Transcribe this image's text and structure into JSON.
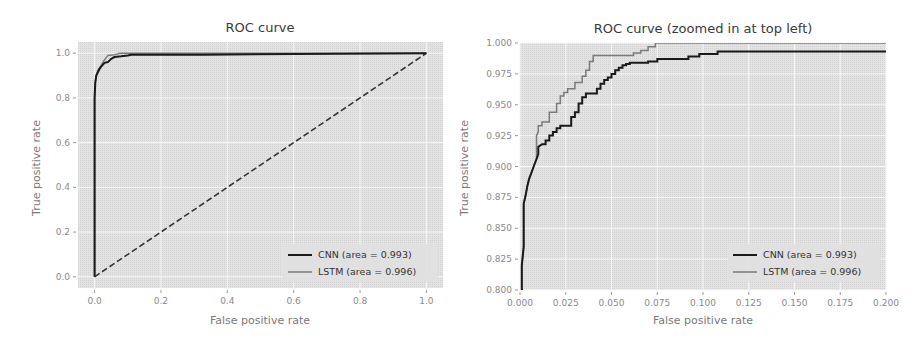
{
  "chart_data": [
    {
      "type": "line",
      "title": "ROC curve",
      "xlabel": "False positive rate",
      "ylabel": "True positive rate",
      "xlim": [
        -0.05,
        1.05
      ],
      "ylim": [
        -0.05,
        1.05
      ],
      "xticks": [
        0.0,
        0.2,
        0.4,
        0.6,
        0.8,
        1.0
      ],
      "xtick_labels": [
        "0.0",
        "0.2",
        "0.4",
        "0.6",
        "0.8",
        "1.0"
      ],
      "yticks": [
        0.0,
        0.2,
        0.4,
        0.6,
        0.8,
        1.0
      ],
      "ytick_labels": [
        "0.0",
        "0.2",
        "0.4",
        "0.6",
        "0.8",
        "1.0"
      ],
      "grid": true,
      "legend_position": "bottom-right",
      "series": [
        {
          "name": "CNN (area = 0.993)",
          "color": "#1a1a1a",
          "style": "solid",
          "x": [
            0.0,
            0.0,
            0.002,
            0.005,
            0.01,
            0.015,
            0.02,
            0.03,
            0.04,
            0.05,
            0.06,
            0.08,
            0.1,
            0.11,
            0.33,
            1.0
          ],
          "y": [
            0.0,
            0.8,
            0.87,
            0.9,
            0.915,
            0.93,
            0.94,
            0.957,
            0.96,
            0.975,
            0.983,
            0.986,
            0.99,
            0.993,
            0.993,
            1.0
          ]
        },
        {
          "name": "LSTM (area = 0.996)",
          "color": "#7a7a7a",
          "style": "solid",
          "x": [
            0.0,
            0.0,
            0.002,
            0.005,
            0.01,
            0.015,
            0.02,
            0.025,
            0.03,
            0.04,
            0.06,
            0.07,
            0.075,
            1.0
          ],
          "y": [
            0.0,
            0.8,
            0.87,
            0.9,
            0.925,
            0.935,
            0.945,
            0.96,
            0.97,
            0.99,
            0.993,
            0.997,
            1.0,
            1.0
          ]
        },
        {
          "name": "chance",
          "color": "#333333",
          "style": "dashed",
          "x": [
            0.0,
            1.0
          ],
          "y": [
            0.0,
            1.0
          ]
        }
      ]
    },
    {
      "type": "line",
      "title": "ROC curve (zoomed in at top left)",
      "xlabel": "False positive rate",
      "ylabel": "True positive rate",
      "xlim": [
        0.0,
        0.2
      ],
      "ylim": [
        0.8,
        1.0
      ],
      "xticks": [
        0.0,
        0.025,
        0.05,
        0.075,
        0.1,
        0.125,
        0.15,
        0.175,
        0.2
      ],
      "xtick_labels": [
        "0.000",
        "0.025",
        "0.050",
        "0.075",
        "0.100",
        "0.125",
        "0.150",
        "0.175",
        "0.200"
      ],
      "yticks": [
        0.8,
        0.825,
        0.85,
        0.875,
        0.9,
        0.925,
        0.95,
        0.975,
        1.0
      ],
      "ytick_labels": [
        "0.800",
        "0.825",
        "0.850",
        "0.875",
        "0.900",
        "0.925",
        "0.950",
        "0.975",
        "1.000"
      ],
      "grid": true,
      "legend_position": "bottom-right",
      "series": [
        {
          "name": "CNN (area = 0.993)",
          "color": "#1a1a1a",
          "style": "solid",
          "x": [
            0.001,
            0.001,
            0.002,
            0.002,
            0.003,
            0.004,
            0.005,
            0.006,
            0.007,
            0.008,
            0.009,
            0.01,
            0.01,
            0.012,
            0.014,
            0.014,
            0.016,
            0.016,
            0.018,
            0.018,
            0.02,
            0.02,
            0.022,
            0.022,
            0.028,
            0.028,
            0.03,
            0.03,
            0.032,
            0.032,
            0.034,
            0.034,
            0.036,
            0.036,
            0.042,
            0.042,
            0.044,
            0.044,
            0.046,
            0.046,
            0.048,
            0.048,
            0.05,
            0.05,
            0.052,
            0.052,
            0.054,
            0.054,
            0.056,
            0.056,
            0.058,
            0.058,
            0.06,
            0.06,
            0.07,
            0.07,
            0.075,
            0.075,
            0.092,
            0.092,
            0.098,
            0.098,
            0.108,
            0.108,
            0.2
          ],
          "y": [
            0.8,
            0.82,
            0.835,
            0.87,
            0.876,
            0.884,
            0.89,
            0.894,
            0.898,
            0.902,
            0.906,
            0.91,
            0.916,
            0.918,
            0.918,
            0.921,
            0.921,
            0.925,
            0.925,
            0.928,
            0.928,
            0.931,
            0.931,
            0.933,
            0.933,
            0.94,
            0.94,
            0.944,
            0.944,
            0.951,
            0.951,
            0.956,
            0.956,
            0.959,
            0.959,
            0.963,
            0.963,
            0.967,
            0.967,
            0.97,
            0.97,
            0.972,
            0.972,
            0.975,
            0.975,
            0.978,
            0.978,
            0.98,
            0.98,
            0.982,
            0.982,
            0.983,
            0.983,
            0.984,
            0.984,
            0.985,
            0.985,
            0.987,
            0.987,
            0.989,
            0.989,
            0.991,
            0.991,
            0.993,
            0.993
          ]
        },
        {
          "name": "LSTM (area = 0.996)",
          "color": "#7a7a7a",
          "style": "solid",
          "x": [
            0.001,
            0.001,
            0.002,
            0.002,
            0.003,
            0.004,
            0.005,
            0.006,
            0.007,
            0.008,
            0.009,
            0.009,
            0.01,
            0.01,
            0.012,
            0.012,
            0.016,
            0.016,
            0.02,
            0.02,
            0.022,
            0.022,
            0.024,
            0.024,
            0.026,
            0.026,
            0.03,
            0.03,
            0.034,
            0.034,
            0.036,
            0.036,
            0.038,
            0.038,
            0.04,
            0.04,
            0.062,
            0.062,
            0.066,
            0.066,
            0.07,
            0.07,
            0.074,
            0.074,
            0.2
          ],
          "y": [
            0.8,
            0.82,
            0.835,
            0.87,
            0.876,
            0.884,
            0.89,
            0.894,
            0.898,
            0.902,
            0.906,
            0.925,
            0.928,
            0.933,
            0.933,
            0.936,
            0.936,
            0.944,
            0.944,
            0.951,
            0.951,
            0.957,
            0.957,
            0.96,
            0.96,
            0.963,
            0.963,
            0.968,
            0.968,
            0.973,
            0.973,
            0.978,
            0.978,
            0.985,
            0.985,
            0.99,
            0.99,
            0.992,
            0.992,
            0.994,
            0.994,
            0.997,
            0.997,
            1.0,
            1.0
          ]
        }
      ]
    }
  ]
}
